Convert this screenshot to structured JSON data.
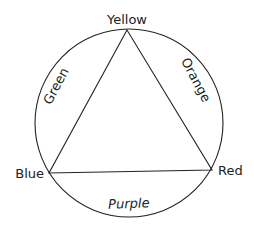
{
  "diagram": {
    "primaries": [
      {
        "label": "Yellow"
      },
      {
        "label": "Blue"
      },
      {
        "label": "Red"
      }
    ],
    "secondaries": [
      {
        "label": "Green"
      },
      {
        "label": "Orange"
      },
      {
        "label": "Purple"
      }
    ]
  }
}
